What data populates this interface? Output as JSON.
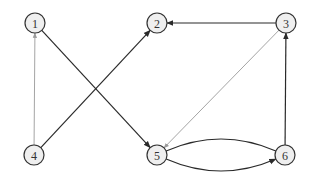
{
  "diagram": {
    "type": "directed-graph",
    "node_radius": 10,
    "colors": {
      "node_fill": "#efefef",
      "node_stroke": "#333333",
      "edge_dark": "#2a2a2a",
      "edge_light": "#9a9a9a"
    },
    "nodes": [
      {
        "id": "1",
        "label": "1",
        "x": 35,
        "y": 23
      },
      {
        "id": "2",
        "label": "2",
        "x": 157,
        "y": 23
      },
      {
        "id": "3",
        "label": "3",
        "x": 286,
        "y": 23
      },
      {
        "id": "4",
        "label": "4",
        "x": 34,
        "y": 155
      },
      {
        "id": "5",
        "label": "5",
        "x": 157,
        "y": 155
      },
      {
        "id": "6",
        "label": "6",
        "x": 285,
        "y": 155
      }
    ],
    "edges": [
      {
        "from": "1",
        "to": "5",
        "style": "dark",
        "arrow": true
      },
      {
        "from": "4",
        "to": "2",
        "style": "dark",
        "arrow": true
      },
      {
        "from": "4",
        "to": "1",
        "style": "light",
        "arrow": true
      },
      {
        "from": "3",
        "to": "2",
        "style": "dark",
        "arrow": true
      },
      {
        "from": "3",
        "to": "5",
        "style": "light",
        "arrow": true
      },
      {
        "from": "6",
        "to": "3",
        "style": "dark",
        "arrow": true
      },
      {
        "from": "5",
        "to": "6",
        "style": "dark",
        "arrow": true,
        "curve": 14
      },
      {
        "from": "6",
        "to": "5",
        "style": "dark",
        "arrow": false,
        "curve": 14
      }
    ]
  }
}
